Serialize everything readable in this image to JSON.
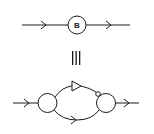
{
  "diagram": {
    "top": {
      "node_label": "B",
      "description": "Propagator line with blob B"
    },
    "equivalence_symbol": "≡",
    "bottom": {
      "description": "Two vertex blobs connected by upper line with triangle and small circle, lower line with arrow"
    },
    "colors": {
      "stroke": "#1a1a1a",
      "background": "#ffffff"
    }
  }
}
